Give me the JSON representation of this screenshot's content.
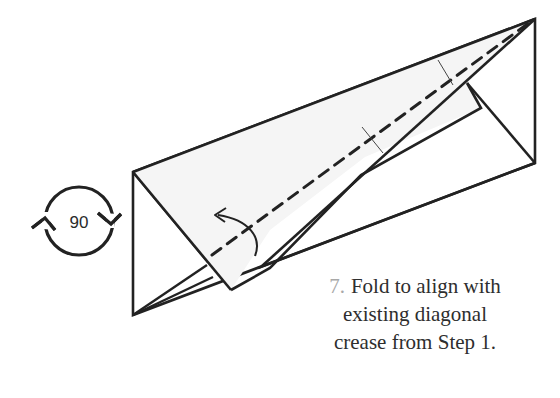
{
  "diagram": {
    "rotation_symbol": {
      "icon": "rotate-90-icon",
      "label": "90"
    },
    "fold_arrow": {
      "icon": "fold-arrow-icon"
    },
    "crease_line": {
      "style": "valley-fold-dashed"
    },
    "colors": {
      "line": "#222222",
      "flap_fill": "#f5f5f5",
      "paper_fill": "#ffffff",
      "step_number": "#a8a8a8",
      "caption_text": "#2e2e2e"
    }
  },
  "caption": {
    "step_number": "7.",
    "line1": "Fold to align with",
    "line2": "existing diagonal",
    "line3": "crease from Step 1."
  }
}
